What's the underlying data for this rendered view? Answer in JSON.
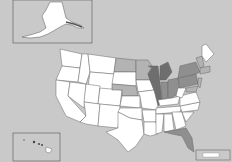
{
  "map": {
    "title": "",
    "background_color": "#c9c9c9",
    "shade_levels": {
      "none": "#ffffff",
      "light": "#b3b3b3",
      "medium": "#8f8f8f",
      "dark": "#6e6e6e"
    },
    "insets": [
      "Alaska",
      "Hawaii"
    ],
    "states": {
      "dark": [
        "Wisconsin",
        "Illinois",
        "Michigan"
      ],
      "medium": [
        "Indiana",
        "Ohio",
        "Pennsylvania",
        "New York"
      ],
      "light": [
        "North Dakota",
        "Minnesota",
        "Nebraska",
        "Vermont",
        "New Hampshire",
        "Massachusetts",
        "Connecticut",
        "New Jersey",
        "Maryland",
        "Florida"
      ],
      "none": [
        "Maine",
        "Washington",
        "Oregon",
        "California",
        "Nevada",
        "Idaho",
        "Montana",
        "Wyoming",
        "Utah",
        "Colorado",
        "Arizona",
        "New Mexico",
        "Texas",
        "Oklahoma",
        "Kansas",
        "South Dakota",
        "Iowa",
        "Missouri",
        "Arkansas",
        "Louisiana",
        "Mississippi",
        "Alabama",
        "Georgia",
        "Tennessee",
        "Kentucky",
        "South Carolina",
        "North Carolina",
        "Virginia",
        "West Virginia",
        "Alaska",
        "Hawaii"
      ]
    },
    "legend": {
      "items": [
        ""
      ]
    }
  }
}
